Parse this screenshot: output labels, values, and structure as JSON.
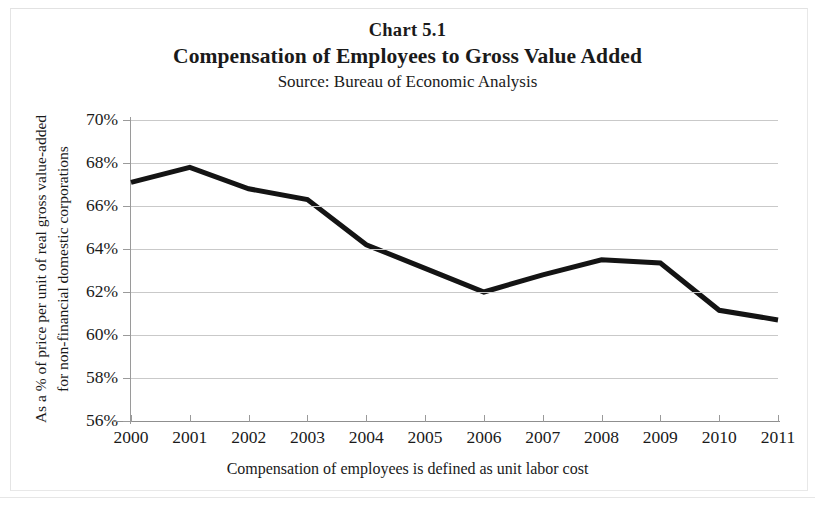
{
  "header": {
    "chart_number": "Chart  5.1",
    "title": "Compensation of Employees to Gross Value Added",
    "source": "Source: Bureau of Economic Analysis"
  },
  "axes": {
    "y_title_line1": "As a % of price per unit of real gross value-added",
    "y_title_line2": "for non-financial domestic corporations",
    "x_footnote": "Compensation of employees is defined as unit labor cost"
  },
  "chart_data": {
    "type": "line",
    "title": "Compensation of Employees to Gross Value Added",
    "subtitle": "Source: Bureau of Economic Analysis",
    "chart_number": "Chart  5.1",
    "xlabel": "Compensation of employees is defined as unit labor cost",
    "ylabel": "As a % of price per unit of real gross value-added for non-financial domestic corporations",
    "categories": [
      "2000",
      "2001",
      "2002",
      "2003",
      "2004",
      "2005",
      "2006",
      "2007",
      "2008",
      "2009",
      "2010",
      "2011"
    ],
    "values": [
      67.1,
      67.8,
      66.8,
      66.3,
      64.2,
      63.1,
      62.0,
      62.8,
      63.5,
      63.35,
      61.15,
      60.7
    ],
    "x_tick_labels": [
      "2000",
      "2001",
      "2002",
      "2003",
      "2004",
      "2005",
      "2006",
      "2007",
      "2008",
      "2009",
      "2010",
      "2011"
    ],
    "y_tick_labels": [
      "70%",
      "68%",
      "66%",
      "64%",
      "62%",
      "60%",
      "58%",
      "56%"
    ],
    "y_tick_values": [
      70,
      68,
      66,
      64,
      62,
      60,
      58,
      56
    ],
    "ylim": [
      56,
      70
    ],
    "xlim": [
      "2000",
      "2011"
    ],
    "grid": true,
    "grid_axis": "y",
    "legend": false,
    "series": [
      {
        "name": "Compensation of employees as % of gross value added",
        "color": "#141414",
        "line_width": 5,
        "values": [
          67.1,
          67.8,
          66.8,
          66.3,
          64.2,
          63.1,
          62.0,
          62.8,
          63.5,
          63.35,
          61.15,
          60.7
        ]
      }
    ],
    "colors": {
      "line": "#141414",
      "gridline": "#c9c9c9",
      "axis": "#8f8f8f",
      "background": "#ffffff",
      "text": "#1a1a1a"
    }
  }
}
